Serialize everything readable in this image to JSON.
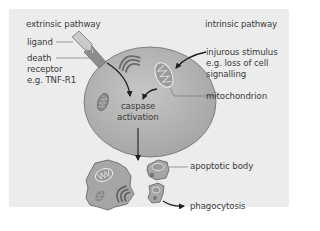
{
  "diagram": {
    "title_left": "extrinsic pathway",
    "title_right": "intrinsic pathway",
    "labels": {
      "ligand": "ligand",
      "death_receptor_line1": "death",
      "death_receptor_line2": "receptor",
      "death_receptor_line3": "e.g. TNF-R1",
      "stimulus_line1": "injurous stimulus",
      "stimulus_line2": "e.g. loss of cell",
      "stimulus_line3": "signalling",
      "mitochondrion": "mitochondrion",
      "caspase_line1": "caspase",
      "caspase_line2": "activation",
      "apoptotic_body": "apoptotic body",
      "phagocytosis": "phagocytosis"
    },
    "colors": {
      "panel_bg": "#ececec",
      "cell_fill": "#b4b4b4",
      "cell_stroke": "#6e6e6e",
      "ligand_fill": "#c8c8c8",
      "receptor_fill": "#8c8c8c",
      "text": "#3a3a3a",
      "arrow": "#1e1e1e"
    }
  }
}
